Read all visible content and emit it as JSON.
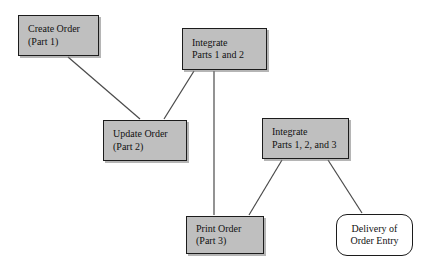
{
  "diagram": {
    "type": "node-link-diagram",
    "canvas": {
      "width": 432,
      "height": 267,
      "background": "#ffffff"
    },
    "style": {
      "process_fill": "#bfbfbf",
      "terminal_fill": "#ffffff",
      "border_color": "#1c1c1c",
      "edge_color": "#4a4a4a"
    },
    "nodes": [
      {
        "id": "create-order",
        "shape": "rectangle",
        "lines": [
          "Create Order",
          "(Part 1)"
        ],
        "x": 18,
        "y": 15,
        "w": 81,
        "h": 41
      },
      {
        "id": "integrate-1-2",
        "shape": "rectangle",
        "lines": [
          "Integrate",
          "Parts 1 and 2"
        ],
        "x": 182,
        "y": 28,
        "w": 85,
        "h": 42
      },
      {
        "id": "update-order",
        "shape": "rectangle",
        "lines": [
          "Update Order",
          "(Part 2)"
        ],
        "x": 103,
        "y": 120,
        "w": 84,
        "h": 41
      },
      {
        "id": "integrate-1-2-3",
        "shape": "rectangle",
        "lines": [
          "Integrate",
          "Parts 1, 2, and 3"
        ],
        "x": 262,
        "y": 118,
        "w": 87,
        "h": 41
      },
      {
        "id": "print-order",
        "shape": "rectangle",
        "lines": [
          "Print Order",
          "(Part 3)"
        ],
        "x": 186,
        "y": 216,
        "w": 78,
        "h": 38
      },
      {
        "id": "delivery-order-entry",
        "shape": "rounded-rectangle",
        "lines": [
          "Delivery of",
          "Order Entry"
        ],
        "x": 336,
        "y": 214,
        "w": 77,
        "h": 42
      }
    ],
    "edges": [
      {
        "id": "edge-create-to-update",
        "from": "create-order",
        "to": "update-order",
        "x1": 68,
        "y1": 57,
        "x2": 140,
        "y2": 119
      },
      {
        "id": "edge-update-to-integrate12",
        "from": "update-order",
        "to": "integrate-1-2",
        "x1": 164,
        "y1": 119,
        "x2": 194,
        "y2": 71
      },
      {
        "id": "edge-integrate12-to-print",
        "from": "integrate-1-2",
        "to": "print-order",
        "x1": 214,
        "y1": 71,
        "x2": 214,
        "y2": 215
      },
      {
        "id": "edge-print-to-integrate123",
        "from": "print-order",
        "to": "integrate-1-2-3",
        "x1": 249,
        "y1": 215,
        "x2": 282,
        "y2": 160
      },
      {
        "id": "edge-integrate123-to-delivery",
        "from": "integrate-1-2-3",
        "to": "delivery-order-entry",
        "x1": 328,
        "y1": 160,
        "x2": 362,
        "y2": 213
      }
    ]
  }
}
